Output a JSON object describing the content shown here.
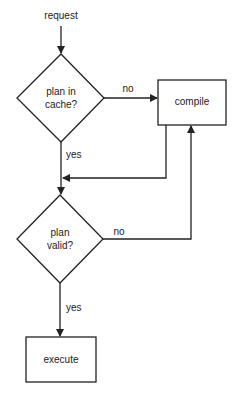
{
  "diagram": {
    "type": "flowchart",
    "start_label": "request",
    "nodes": [
      {
        "id": "cache_check",
        "shape": "diamond",
        "label_line1": "plan in",
        "label_line2": "cache?"
      },
      {
        "id": "compile",
        "shape": "rectangle",
        "label": "compile"
      },
      {
        "id": "valid_check",
        "shape": "diamond",
        "label_line1": "plan",
        "label_line2": "valid?"
      },
      {
        "id": "execute",
        "shape": "rectangle",
        "label": "execute"
      }
    ],
    "edges": [
      {
        "from": "request",
        "to": "cache_check",
        "label": ""
      },
      {
        "from": "cache_check",
        "to": "compile",
        "label": "no"
      },
      {
        "from": "cache_check",
        "to": "valid_check",
        "label": "yes"
      },
      {
        "from": "compile",
        "to": "valid_check",
        "label": ""
      },
      {
        "from": "valid_check",
        "to": "compile",
        "label": "no"
      },
      {
        "from": "valid_check",
        "to": "execute",
        "label": "yes"
      }
    ],
    "edge_labels": {
      "cache_no": "no",
      "cache_yes": "yes",
      "valid_no": "no",
      "valid_yes": "yes"
    },
    "colors": {
      "stroke": "#222222",
      "background": "#ffffff",
      "text": "#222222"
    }
  }
}
